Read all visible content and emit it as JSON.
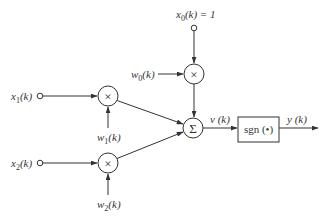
{
  "diagram": {
    "title": "",
    "type": "single neuron / adaptive linear combiner with sign activation",
    "inputs": {
      "bias": {
        "label": "x0(k) = 1",
        "sub": "0",
        "var": "x",
        "suffix": "(k) = 1"
      },
      "x1": {
        "label": "x1(k)",
        "var": "x",
        "sub": "1",
        "suffix": "(k)"
      },
      "x2": {
        "label": "x2(k)",
        "var": "x",
        "sub": "2",
        "suffix": "(k)"
      }
    },
    "weights": {
      "w0": {
        "label": "w0(k)",
        "var": "w",
        "sub": "0",
        "suffix": "(k)"
      },
      "w1": {
        "label": "w1(k)",
        "var": "w",
        "sub": "1",
        "suffix": "(k)"
      },
      "w2": {
        "label": "w2(k)",
        "var": "w",
        "sub": "2",
        "suffix": "(k)"
      }
    },
    "multiplier_symbol": "×",
    "summer_symbol": "Σ",
    "summer_output": {
      "label": "v (k)"
    },
    "activation": {
      "label": "sgn (•)"
    },
    "output": {
      "label": "y (k)"
    },
    "edges": [
      [
        "x0",
        "mult0"
      ],
      [
        "w0",
        "mult0"
      ],
      [
        "x1",
        "mult1"
      ],
      [
        "w1",
        "mult1"
      ],
      [
        "x2",
        "mult2"
      ],
      [
        "w2",
        "mult2"
      ],
      [
        "mult0",
        "sum"
      ],
      [
        "mult1",
        "sum"
      ],
      [
        "mult2",
        "sum"
      ],
      [
        "sum",
        "sgn"
      ],
      [
        "sgn",
        "output"
      ]
    ],
    "colors": {
      "stroke": "#333333",
      "background": "#ffffff"
    }
  }
}
